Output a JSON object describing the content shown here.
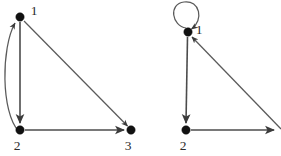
{
  "figure": {
    "background_color": "#ffffff",
    "edge_color": "#4c4c4c",
    "node_color": "#111111",
    "label_color": "#2b2b2b",
    "width": 281,
    "height": 156
  },
  "graphs": [
    {
      "id": "left-graph",
      "name": "left-directed-graph",
      "nodes": [
        {
          "id": "L1",
          "label": "1",
          "x": 20,
          "y": 17,
          "r": 4.2,
          "label_x": 34,
          "label_y": 12
        },
        {
          "id": "L2",
          "label": "2",
          "x": 20,
          "y": 130,
          "r": 4.2,
          "label_x": 17,
          "label_y": 147
        },
        {
          "id": "L3",
          "label": "3",
          "x": 131,
          "y": 130,
          "r": 4.2,
          "label_x": 128,
          "label_y": 147
        }
      ],
      "edges": [
        {
          "id": "L1-L2",
          "from": "1",
          "to": "2",
          "shape": "straight",
          "directed": true
        },
        {
          "id": "L2-L1",
          "from": "2",
          "to": "1",
          "shape": "curved-left",
          "directed": true
        },
        {
          "id": "L1-L3",
          "from": "1",
          "to": "3",
          "shape": "straight",
          "directed": true
        },
        {
          "id": "L2-L3",
          "from": "2",
          "to": "3",
          "shape": "straight",
          "directed": true
        }
      ]
    },
    {
      "id": "right-graph",
      "name": "right-directed-graph",
      "nodes": [
        {
          "id": "R1",
          "label": "1",
          "x": 188,
          "y": 32,
          "r": 4.2,
          "label_x": 199,
          "label_y": 31
        },
        {
          "id": "R2",
          "label": "2",
          "x": 186,
          "y": 130,
          "r": 4.2,
          "label_x": 183,
          "label_y": 147
        }
      ],
      "edges": [
        {
          "id": "R1-R1",
          "from": "1",
          "to": "1",
          "shape": "self-loop",
          "directed": true
        },
        {
          "id": "R1-R2",
          "from": "1",
          "to": "2",
          "shape": "straight",
          "directed": true
        },
        {
          "id": "R2-R3",
          "from": "2",
          "to": "3",
          "shape": "straight",
          "directed": true,
          "target_offscreen": true
        },
        {
          "id": "R3-R1",
          "from": "3",
          "to": "1",
          "shape": "straight",
          "directed": true,
          "source_offscreen": true
        }
      ]
    }
  ],
  "labels": {
    "left_node_1": "1",
    "left_node_2": "2",
    "left_node_3": "3",
    "right_node_1": "1",
    "right_node_2": "2"
  }
}
